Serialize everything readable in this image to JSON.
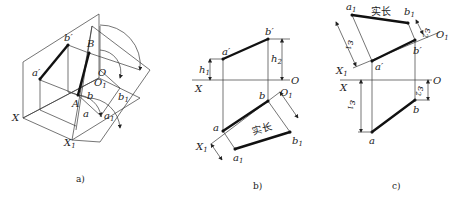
{
  "figure": {
    "panels": [
      {
        "id": "a",
        "caption": "a)",
        "labels": {
          "a_prime": "a′",
          "b_prime": "b′",
          "B": "B",
          "A": "A",
          "O": "O",
          "O1": "O",
          "O1_sub": "1",
          "b": "b",
          "b1": "b",
          "b1_sub": "1",
          "a": "a",
          "a1": "a",
          "a1_sub": "1",
          "X": "X",
          "X1": "X",
          "X1_sub": "1"
        }
      },
      {
        "id": "b",
        "caption": "b)",
        "labels": {
          "a_prime": "a′",
          "b_prime": "b′",
          "h1": "h",
          "h1_sub": "1",
          "h2": "h",
          "h2_sub": "2",
          "X": "X",
          "O": "O",
          "O1": "O",
          "O1_sub": "1",
          "a": "a",
          "b": "b",
          "X1": "X",
          "X1_sub": "1",
          "a1": "a",
          "a1_sub": "1",
          "b1": "b",
          "b1_sub": "1",
          "h1b": "h",
          "h1b_sub": "1",
          "h2b": "h",
          "h2b_sub": "2",
          "true_length": "实长"
        }
      },
      {
        "id": "c",
        "caption": "c)",
        "labels": {
          "a1": "a",
          "a1_sub": "1",
          "b1": "b",
          "b1_sub": "1",
          "true_length": "实长",
          "e2": "ε",
          "e2_sub": "2",
          "O1": "O",
          "O1_sub": "1",
          "e1": "ε",
          "e1_sub": "1",
          "b_prime": "b′",
          "a_prime": "a′",
          "X1": "X",
          "X1_sub": "1",
          "X": "X",
          "O": "O",
          "e2b": "ε",
          "e2b_sub": "2",
          "e1b": "ε",
          "e1b_sub": "1",
          "b": "b",
          "a": "a"
        }
      }
    ]
  }
}
